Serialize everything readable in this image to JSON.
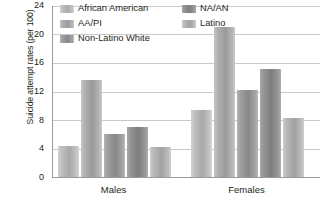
{
  "chart_data": {
    "type": "bar",
    "title": "",
    "subtitle": "",
    "xlabel": "",
    "ylabel": "Suicide attempt rates (per 100)",
    "ylim": [
      0,
      24
    ],
    "yticks": [
      0,
      4,
      8,
      12,
      16,
      20,
      24
    ],
    "ytick_labels": [
      "0",
      "4",
      "8",
      "12",
      "16",
      "20",
      "24"
    ],
    "grid": true,
    "legend_position": "top",
    "categories": [
      "Males",
      "Females"
    ],
    "series": [
      {
        "name": "African American",
        "color": "#b4b4b4",
        "values": [
          4.3,
          9.4
        ]
      },
      {
        "name": "AA/PI",
        "color": "#a8a8a8",
        "values": [
          13.5,
          21.0
        ]
      },
      {
        "name": "Non-Latino White",
        "color": "#8d8d8d",
        "values": [
          6.0,
          12.2
        ]
      },
      {
        "name": "NA/AN",
        "color": "#828282",
        "values": [
          7.0,
          15.1
        ]
      },
      {
        "name": "Latino",
        "color": "#bdbdbd",
        "values": [
          4.2,
          8.3
        ]
      }
    ]
  },
  "legend": {
    "items": [
      {
        "label": "African American"
      },
      {
        "label": "AA/PI"
      },
      {
        "label": "Non-Latino White"
      },
      {
        "label": "NA/AN"
      },
      {
        "label": "Latino"
      }
    ]
  },
  "axis": {
    "y_title": "Suicide attempt rates (per 100)",
    "y_ticks": [
      "24",
      "20",
      "16",
      "12",
      "8",
      "4",
      "0"
    ],
    "x_groups": [
      "Males",
      "Females"
    ]
  }
}
